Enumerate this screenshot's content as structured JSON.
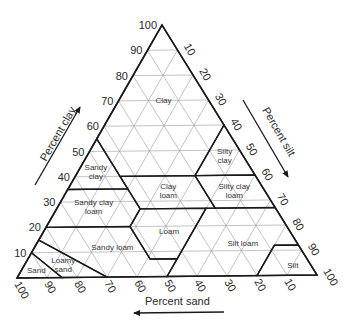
{
  "colors": {
    "line": "#1a1a1a",
    "grid": "#9a9a9a",
    "text": "#2a2a2a",
    "background": "#ffffff"
  },
  "geometry": {
    "apex_clay": [
      162,
      25
    ],
    "corner_sand": [
      17,
      278
    ],
    "corner_silt": [
      317,
      275
    ]
  },
  "axes": {
    "clay": {
      "title": "Percent clay",
      "ticks": [
        10,
        20,
        30,
        40,
        50,
        60,
        70,
        80,
        90,
        100
      ],
      "arrow": "up"
    },
    "silt": {
      "title": "Percent silt",
      "ticks": [
        10,
        20,
        30,
        40,
        50,
        60,
        70,
        80,
        90,
        100
      ],
      "arrow": "down"
    },
    "sand": {
      "title": "Percent sand",
      "ticks": [
        100,
        90,
        80,
        70,
        60,
        50,
        40,
        30,
        20,
        10
      ],
      "arrow": "left"
    }
  },
  "chart_data": {
    "type": "ternary",
    "axes": [
      "Percent clay",
      "Percent silt",
      "Percent sand"
    ],
    "tick_step": 10,
    "grid": true,
    "regions": [
      {
        "name": "Clay",
        "label": [
          "Clay"
        ],
        "label_pos": [
          70,
          15,
          15
        ],
        "polygon": [
          [
            100,
            0,
            0
          ],
          [
            55,
            45,
            0
          ],
          [
            40,
            45,
            15
          ],
          [
            40,
            20,
            40
          ],
          [
            60,
            0,
            40
          ]
        ]
      },
      {
        "name": "Sandy clay",
        "label": [
          "Sandy",
          "clay"
        ],
        "label_pos": [
          42,
          52,
          6
        ],
        "polygon": [
          [
            55,
            45,
            0
          ],
          [
            35,
            65,
            0
          ],
          [
            35,
            45,
            20
          ],
          [
            40,
            45,
            15
          ]
        ]
      },
      {
        "name": "Silty clay",
        "label": [
          "Silty",
          "clay"
        ],
        "label_pos": [
          48,
          6,
          46
        ],
        "polygon": [
          [
            60,
            0,
            40
          ],
          [
            40,
            20,
            40
          ],
          [
            40,
            0,
            60
          ]
        ]
      },
      {
        "name": "Clay loam",
        "label": [
          "Clay",
          "loam"
        ],
        "label_pos": [
          34,
          32,
          34
        ],
        "polygon": [
          [
            40,
            45,
            15
          ],
          [
            27,
            45,
            28
          ],
          [
            27,
            20,
            53
          ],
          [
            40,
            20,
            40
          ]
        ]
      },
      {
        "name": "Silty clay loam",
        "label": [
          "Silty clay",
          "loam"
        ],
        "label_pos": [
          34,
          10,
          56
        ],
        "polygon": [
          [
            40,
            20,
            40
          ],
          [
            27,
            20,
            53
          ],
          [
            27,
            0,
            73
          ],
          [
            40,
            0,
            60
          ]
        ]
      },
      {
        "name": "Sandy clay loam",
        "label": [
          "Sandy clay",
          "loam"
        ],
        "label_pos": [
          28,
          60,
          12
        ],
        "polygon": [
          [
            35,
            65,
            0
          ],
          [
            35,
            45,
            20
          ],
          [
            27,
            45,
            28
          ],
          [
            20,
            52,
            28
          ],
          [
            20,
            80,
            0
          ]
        ]
      },
      {
        "name": "Loam",
        "label": [
          "Loam"
        ],
        "label_pos": [
          18,
          40,
          42
        ],
        "polygon": [
          [
            27,
            45,
            28
          ],
          [
            27,
            23,
            50
          ],
          [
            7,
            43,
            50
          ],
          [
            7,
            52,
            41
          ],
          [
            20,
            52,
            28
          ]
        ]
      },
      {
        "name": "Silt loam",
        "label": [
          "Silt loam"
        ],
        "label_pos": [
          13,
          18,
          69
        ],
        "polygon": [
          [
            27,
            23,
            50
          ],
          [
            27,
            0,
            73
          ],
          [
            12,
            0,
            88
          ],
          [
            12,
            8,
            80
          ],
          [
            0,
            20,
            80
          ],
          [
            0,
            50,
            50
          ],
          [
            7,
            43,
            50
          ]
        ]
      },
      {
        "name": "Silt",
        "label": [
          "Silt"
        ],
        "label_pos": [
          4,
          6,
          90
        ],
        "polygon": [
          [
            12,
            0,
            88
          ],
          [
            0,
            0,
            100
          ],
          [
            0,
            20,
            80
          ],
          [
            12,
            8,
            80
          ]
        ]
      },
      {
        "name": "Sandy loam",
        "label": [
          "Sandy loam"
        ],
        "label_pos": [
          12,
          62,
          26
        ],
        "polygon": [
          [
            20,
            80,
            0
          ],
          [
            20,
            52,
            28
          ],
          [
            7,
            52,
            41
          ],
          [
            7,
            43,
            50
          ],
          [
            0,
            50,
            50
          ],
          [
            0,
            70,
            30
          ],
          [
            15,
            85,
            0
          ]
        ]
      },
      {
        "name": "Loamy sand",
        "label": [
          "Loamy",
          "sand"
        ],
        "label_pos": [
          5,
          82,
          13
        ],
        "polygon": [
          [
            15,
            85,
            0
          ],
          [
            0,
            70,
            30
          ],
          [
            0,
            85,
            15
          ],
          [
            10,
            90,
            0
          ]
        ]
      },
      {
        "name": "Sand",
        "label": [
          "Sand"
        ],
        "label_pos": [
          3,
          92,
          5
        ],
        "polygon": [
          [
            10,
            90,
            0
          ],
          [
            0,
            85,
            15
          ],
          [
            0,
            100,
            0
          ]
        ]
      }
    ]
  }
}
